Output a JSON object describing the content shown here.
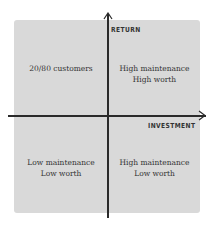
{
  "diagram": {
    "type": "quadrant-matrix",
    "axes": {
      "y_label": "RETURN",
      "x_label": "INVESTMENT"
    },
    "quadrants": {
      "top_left": {
        "lines": [
          "20/80 customers"
        ]
      },
      "top_right": {
        "lines": [
          "High maintenance",
          "High worth"
        ]
      },
      "bottom_left": {
        "lines": [
          "Low maintenance",
          "Low worth"
        ]
      },
      "bottom_right": {
        "lines": [
          "High maintenance",
          "Low worth"
        ]
      }
    },
    "colors": {
      "background": "#ffffff",
      "panel": "#d9d9d9",
      "axis": "#2a2a2a",
      "text": "#333333"
    }
  }
}
